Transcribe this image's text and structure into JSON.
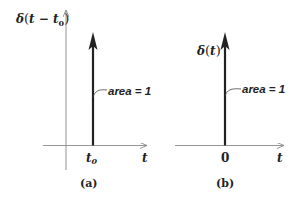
{
  "diagram": {
    "panels": [
      {
        "id": "a",
        "caption": "(a)",
        "y_axis_label_fn": "δ",
        "y_axis_label_arg": "t − t",
        "y_axis_label_sub": "0",
        "impulse_location_label": "t",
        "impulse_location_sub": "0",
        "x_axis_label": "t",
        "area_label": "area = 1"
      },
      {
        "id": "b",
        "caption": "(b)",
        "y_axis_label_fn": "δ",
        "y_axis_label_arg": "t",
        "impulse_location_label": "0",
        "x_axis_label": "t",
        "area_label": "area = 1"
      }
    ],
    "colors": {
      "axis": "#8a8a8a",
      "impulse": "#222222",
      "text": "#222222"
    }
  }
}
